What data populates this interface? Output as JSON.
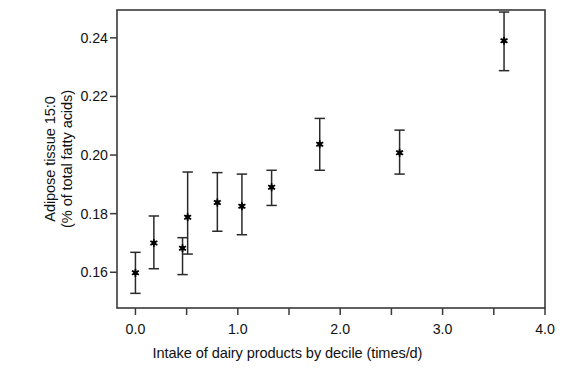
{
  "chart_data": {
    "type": "scatter",
    "title": "",
    "xlabel": "Intake of dairy products by decile (times/d)",
    "ylabel_line1": "Adipose tissue 15:0",
    "ylabel_line2": "(% of total fatty acids)",
    "xlim": [
      -0.18,
      4.0
    ],
    "ylim": [
      0.1478,
      0.2495
    ],
    "xticks": [
      0.0,
      0.5,
      1.0,
      1.5,
      2.0,
      2.5,
      3.0,
      3.5,
      4.0
    ],
    "xticklabels": [
      "0.0",
      "",
      "1.0",
      "",
      "2.0",
      "",
      "3.0",
      "",
      "4.0"
    ],
    "yticks": [
      0.16,
      0.18,
      0.2,
      0.22,
      0.24
    ],
    "yticklabels": [
      "0.16",
      "0.18",
      "0.20",
      "0.22",
      "0.24"
    ],
    "grid": false,
    "legend": "none",
    "marker": "asterisk",
    "error_bars": "vertical",
    "series": [
      {
        "name": "Adipose tissue 15:0 by decile of dairy intake",
        "x": [
          0.0,
          0.18,
          0.46,
          0.51,
          0.8,
          1.04,
          1.33,
          1.8,
          2.58,
          3.6
        ],
        "y": [
          0.1598,
          0.17,
          0.1682,
          0.1788,
          0.1838,
          0.1825,
          0.189,
          0.2037,
          0.2008,
          0.239
        ],
        "y_low": [
          0.1528,
          0.1612,
          0.1592,
          0.1662,
          0.174,
          0.1728,
          0.1828,
          0.1948,
          0.1935,
          0.2288
        ],
        "y_high": [
          0.1668,
          0.1792,
          0.1718,
          0.1942,
          0.194,
          0.1935,
          0.1948,
          0.2125,
          0.2085,
          0.2488
        ]
      }
    ],
    "colors": {
      "marker": "#000000",
      "error_bar": "#2a2a2a",
      "axis": "#3a3a3a",
      "background": "#ffffff"
    }
  },
  "geometry": {
    "plot_left": 117,
    "plot_right": 545,
    "plot_top": 10,
    "plot_bottom": 308
  }
}
